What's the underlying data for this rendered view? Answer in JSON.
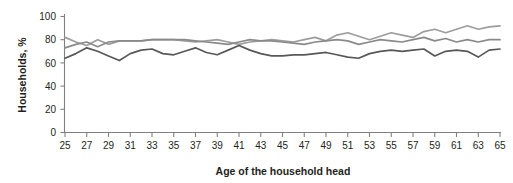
{
  "chart_data": {
    "type": "line",
    "title": "",
    "subtitle": "",
    "xlabel": "Age of the household head",
    "ylabel": "Households, %",
    "xlim": [
      25,
      65
    ],
    "ylim": [
      0,
      100
    ],
    "grid": false,
    "legend": "none",
    "x": [
      25,
      26,
      27,
      28,
      29,
      30,
      31,
      32,
      33,
      34,
      35,
      36,
      37,
      38,
      39,
      40,
      41,
      42,
      43,
      44,
      45,
      46,
      47,
      48,
      49,
      50,
      51,
      52,
      53,
      54,
      55,
      56,
      57,
      58,
      59,
      60,
      61,
      62,
      63,
      64,
      65
    ],
    "xticks": [
      25,
      27,
      29,
      31,
      33,
      35,
      37,
      39,
      41,
      43,
      45,
      47,
      49,
      51,
      53,
      55,
      57,
      59,
      61,
      63,
      65
    ],
    "xtick_labels": [
      "25",
      "27",
      "29",
      "31",
      "33",
      "35",
      "37",
      "39",
      "41",
      "43",
      "45",
      "47",
      "49",
      "51",
      "53",
      "55",
      "57",
      "59",
      "61",
      "63",
      "65"
    ],
    "yticks": [
      0,
      20,
      40,
      60,
      80,
      100
    ],
    "ytick_labels": [
      "0",
      "20",
      "40",
      "60",
      "80",
      "100"
    ],
    "series": [
      {
        "name": "series-light-gray",
        "color": "#9d9d9d",
        "values": [
          82,
          78,
          75,
          80,
          76,
          79,
          79,
          79,
          80,
          80,
          80,
          79,
          78,
          79,
          80,
          78,
          76,
          78,
          79,
          80,
          79,
          78,
          80,
          82,
          79,
          84,
          86,
          83,
          80,
          83,
          86,
          84,
          82,
          87,
          89,
          86,
          89,
          92,
          89,
          91,
          92
        ]
      },
      {
        "name": "series-mid-gray",
        "color": "#8a8a8a",
        "values": [
          73,
          76,
          78,
          74,
          78,
          79,
          79,
          79,
          80,
          80,
          80,
          80,
          79,
          78,
          77,
          76,
          78,
          80,
          79,
          79,
          78,
          77,
          76,
          78,
          79,
          80,
          79,
          76,
          78,
          80,
          79,
          78,
          80,
          82,
          79,
          81,
          78,
          80,
          78,
          80,
          80
        ]
      },
      {
        "name": "series-dark-gray",
        "color": "#585858",
        "values": [
          64,
          68,
          73,
          70,
          66,
          62,
          68,
          71,
          72,
          68,
          67,
          70,
          73,
          69,
          67,
          71,
          75,
          71,
          68,
          66,
          66,
          67,
          67,
          68,
          69,
          67,
          65,
          64,
          68,
          70,
          71,
          70,
          71,
          72,
          66,
          70,
          71,
          70,
          65,
          71,
          72
        ]
      }
    ]
  },
  "axes": {
    "ylabel": "Households, %",
    "xlabel": "Age of the household head"
  }
}
